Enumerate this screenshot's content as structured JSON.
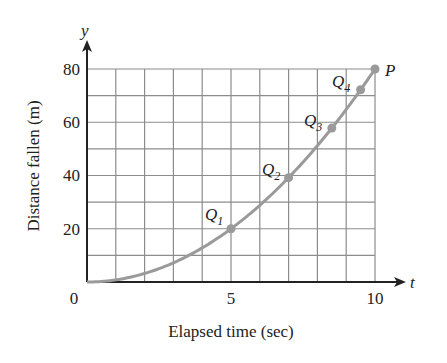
{
  "chart_data": {
    "type": "line",
    "title": "",
    "xlabel": "Elapsed time (sec)",
    "ylabel": "Distance fallen (m)",
    "x_axis_symbol": "t",
    "y_axis_symbol": "y",
    "xlim": [
      0,
      10
    ],
    "ylim": [
      0,
      80
    ],
    "x_ticks": [
      0,
      5,
      10
    ],
    "y_ticks": [
      20,
      40,
      60,
      80
    ],
    "origin_label": "0",
    "grid": true,
    "grid_x_step": 1,
    "grid_y_step": 10,
    "legend": null,
    "series": [
      {
        "name": "y = 0.8 t^2",
        "x": [
          0,
          1,
          2,
          3,
          4,
          5,
          6,
          7,
          8,
          9,
          10
        ],
        "y": [
          0,
          0.8,
          3.2,
          7.2,
          12.8,
          20,
          28.8,
          39.2,
          51.2,
          64.8,
          80
        ]
      }
    ],
    "points": [
      {
        "label": "Q",
        "subscript": "1",
        "t": 5,
        "y": 20
      },
      {
        "label": "Q",
        "subscript": "2",
        "t": 7,
        "y": 39.2
      },
      {
        "label": "Q",
        "subscript": "3",
        "t": 8.5,
        "y": 57.8
      },
      {
        "label": "Q",
        "subscript": "4",
        "t": 9.5,
        "y": 72.2
      },
      {
        "label": "P",
        "subscript": "",
        "t": 10,
        "y": 80
      }
    ]
  },
  "labels": {
    "xlabel": "Elapsed time (sec)",
    "ylabel": "Distance fallen (m)",
    "t": "t",
    "y": "y",
    "origin": "0",
    "xtick5": "5",
    "xtick10": "10",
    "ytick20": "20",
    "ytick40": "40",
    "ytick60": "60",
    "ytick80": "80",
    "Q": "Q",
    "P": "P",
    "s1": "1",
    "s2": "2",
    "s3": "3",
    "s4": "4"
  },
  "colors": {
    "curve": "#9a9a9a",
    "grid": "#8c8c8c",
    "axis": "#222222"
  }
}
